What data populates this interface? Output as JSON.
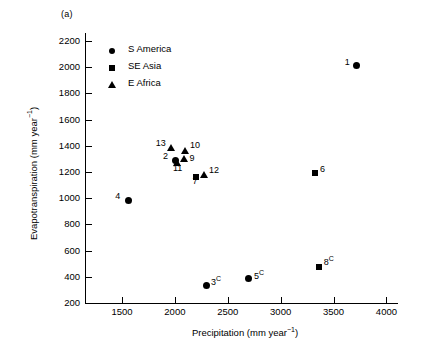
{
  "figure": {
    "panel_label": "(a)"
  },
  "chart_data": {
    "type": "scatter",
    "title": "",
    "xlabel": "Precipitation (mm year-1)",
    "ylabel": "Evapotranspiration (mm year-1)",
    "xlabel_main": "Precipitation (mm year",
    "xlabel_sup": "−1",
    "xlabel_tail": ")",
    "ylabel_main": "Evapotranspiration (mm year",
    "ylabel_sup": "−1",
    "ylabel_tail": ")",
    "xlim": [
      1150,
      4100
    ],
    "ylim": [
      200,
      2260
    ],
    "xticks": [
      1500,
      2000,
      2500,
      3000,
      3500,
      4000
    ],
    "xtick_labels": [
      "1500",
      "2000",
      "2500",
      "3000",
      "3500",
      "4000"
    ],
    "yticks": [
      200,
      400,
      600,
      800,
      1000,
      1200,
      1400,
      1600,
      1800,
      2000,
      2200
    ],
    "ytick_labels": [
      "200",
      "400",
      "600",
      "800",
      "1000",
      "1200",
      "1400",
      "1600",
      "1800",
      "2000",
      "2200"
    ],
    "grid": false,
    "legend_position": "upper-left-inside",
    "series": [
      {
        "name": "S America",
        "marker": "circle",
        "legend_icon": "filled-circle-icon"
      },
      {
        "name": "SE Asia",
        "marker": "square",
        "legend_icon": "filled-square-icon"
      },
      {
        "name": "E Africa",
        "marker": "triangle",
        "legend_icon": "filled-triangle-icon"
      }
    ],
    "points": [
      {
        "id": "1",
        "label": "1",
        "sup": "",
        "x": 3720,
        "y": 2010,
        "series": "S America",
        "marker": "circle",
        "label_dx": -12,
        "label_dy": -4
      },
      {
        "id": "2",
        "label": "2",
        "sup": "",
        "x": 2010,
        "y": 1290,
        "series": "S America",
        "marker": "circle",
        "label_dx": -13,
        "label_dy": -4
      },
      {
        "id": "3",
        "label": "3",
        "sup": "C",
        "x": 2295,
        "y": 332,
        "series": "S America",
        "marker": "circle",
        "label_dx": 5,
        "label_dy": -4
      },
      {
        "id": "4",
        "label": "4",
        "sup": "",
        "x": 1560,
        "y": 985,
        "series": "S America",
        "marker": "circle",
        "label_dx": -13,
        "label_dy": -4
      },
      {
        "id": "5",
        "label": "5",
        "sup": "C",
        "x": 2700,
        "y": 390,
        "series": "S America",
        "marker": "circle",
        "label_dx": 5,
        "label_dy": -2
      },
      {
        "id": "6",
        "label": "6",
        "sup": "",
        "x": 3325,
        "y": 1195,
        "series": "SE Asia",
        "marker": "square",
        "label_dx": 5,
        "label_dy": -4
      },
      {
        "id": "7",
        "label": "7",
        "sup": "",
        "x": 2195,
        "y": 1165,
        "series": "SE Asia",
        "marker": "square",
        "label_dx": -3,
        "label_dy": 4
      },
      {
        "id": "8",
        "label": "8",
        "sup": "C",
        "x": 3360,
        "y": 475,
        "series": "SE Asia",
        "marker": "square",
        "label_dx": 5,
        "label_dy": -5
      },
      {
        "id": "9",
        "label": "9",
        "sup": "",
        "x": 2090,
        "y": 1300,
        "series": "E Africa",
        "marker": "triangle",
        "label_dx": 5,
        "label_dy": -1
      },
      {
        "id": "10",
        "label": "10",
        "sup": "",
        "x": 2095,
        "y": 1360,
        "series": "E Africa",
        "marker": "triangle",
        "label_dx": 5,
        "label_dy": -6
      },
      {
        "id": "11",
        "label": "11",
        "sup": "",
        "x": 2020,
        "y": 1270,
        "series": "E Africa",
        "marker": "triangle",
        "label_dx": -4,
        "label_dy": 5
      },
      {
        "id": "12",
        "label": "12",
        "sup": "",
        "x": 2275,
        "y": 1175,
        "series": "E Africa",
        "marker": "triangle",
        "label_dx": 5,
        "label_dy": -5
      },
      {
        "id": "13",
        "label": "13",
        "sup": "",
        "x": 1960,
        "y": 1380,
        "series": "E Africa",
        "marker": "triangle",
        "label_dx": -15,
        "label_dy": -5
      }
    ]
  }
}
